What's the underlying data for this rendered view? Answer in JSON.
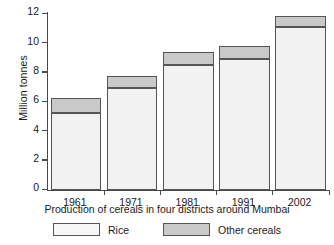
{
  "chart_data": {
    "type": "bar",
    "stacked": true,
    "title": "",
    "xlabel": "Production of cereals in four districts around Mumbai",
    "ylabel": "Million tonnes",
    "categories": [
      "1961",
      "1971",
      "1981",
      "1991",
      "2002"
    ],
    "series": [
      {
        "name": "Rice",
        "values": [
          5.25,
          6.95,
          8.5,
          8.9,
          11.1
        ],
        "color": "#f2f2f2"
      },
      {
        "name": "Other cereals",
        "values": [
          1.0,
          0.85,
          0.9,
          0.9,
          0.75
        ],
        "color": "#c9c9c9"
      }
    ],
    "totals": [
      6.25,
      7.8,
      9.4,
      9.8,
      11.85
    ],
    "ylim": [
      0,
      12
    ],
    "yticks": [
      "0",
      "2",
      "4",
      "6",
      "8",
      "10",
      "12"
    ],
    "grid": false,
    "legend_position": "bottom"
  },
  "legend": {
    "entries": [
      {
        "label": "Rice"
      },
      {
        "label": "Other cereals"
      }
    ]
  }
}
